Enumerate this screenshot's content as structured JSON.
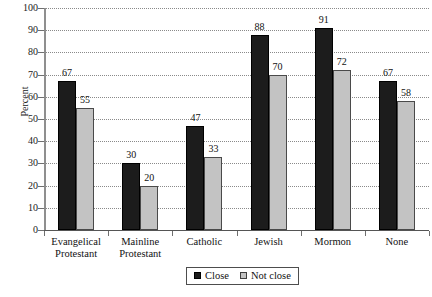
{
  "chart_data": {
    "type": "bar",
    "title": "",
    "xlabel": "",
    "ylabel": "Percent",
    "ylim": [
      0,
      100
    ],
    "ytick_step": 10,
    "yticks": [
      0,
      10,
      20,
      30,
      40,
      50,
      60,
      70,
      80,
      90,
      100
    ],
    "grid": "horizontal-dotted",
    "legend_position": "bottom-center",
    "categories": [
      "Evangelical Protestant",
      "Mainline Protestant",
      "Catholic",
      "Jewish",
      "Mormon",
      "None"
    ],
    "category_lines": [
      [
        "Evangelical",
        "Protestant"
      ],
      [
        "Mainline",
        "Protestant"
      ],
      [
        "Catholic"
      ],
      [
        "Jewish"
      ],
      [
        "Mormon"
      ],
      [
        "None"
      ]
    ],
    "series": [
      {
        "name": "Close",
        "color": "#1c1c1c",
        "values": [
          67,
          30,
          47,
          88,
          91,
          67
        ]
      },
      {
        "name": "Not close",
        "color": "#c3c3c3",
        "values": [
          55,
          20,
          33,
          70,
          72,
          58
        ]
      }
    ]
  },
  "legend": {
    "items": [
      {
        "label": "Close",
        "swatch": "black-square-swatch"
      },
      {
        "label": "Not close",
        "swatch": "gray-square-swatch"
      }
    ]
  }
}
